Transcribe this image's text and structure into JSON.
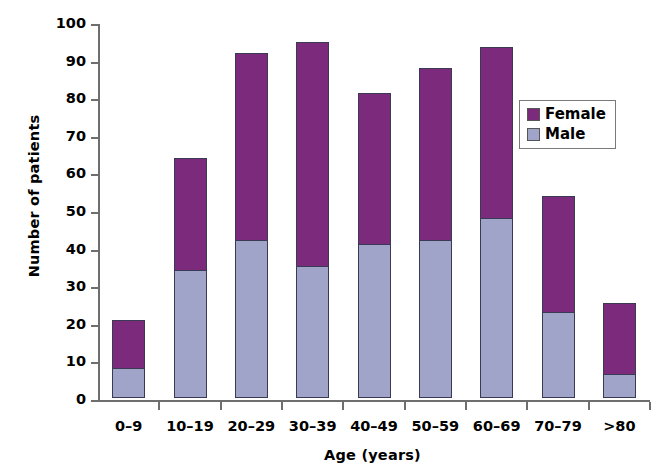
{
  "chart_data": {
    "type": "bar",
    "stacked": true,
    "title": "",
    "xlabel": "Age (years)",
    "ylabel": "Number of patients",
    "categories": [
      "0–9",
      "10–19",
      "20–29",
      "30–39",
      "40–49",
      "50–59",
      "60–69",
      "70–79",
      ">80"
    ],
    "series": [
      {
        "name": "Male",
        "color": "#a0a4c9",
        "values": [
          8,
          34,
          42,
          35,
          41,
          42,
          48,
          23,
          6.5
        ]
      },
      {
        "name": "Female",
        "color": "#7c2a7c",
        "values": [
          13,
          30,
          50,
          60,
          40.5,
          46,
          45.5,
          31,
          19
        ]
      }
    ],
    "totals": [
      21,
      64,
      92,
      95,
      81.5,
      88,
      93.5,
      54,
      25.5
    ],
    "ylim": [
      0,
      100
    ],
    "yticks": [
      0,
      10,
      20,
      30,
      40,
      50,
      60,
      70,
      80,
      90,
      100
    ],
    "ytick_labels": [
      "0",
      "10",
      "20",
      "30",
      "40",
      "50",
      "60",
      "70",
      "80",
      "90",
      "100"
    ],
    "grid": false,
    "legend_position": "upper right",
    "legend_entries": [
      "Female",
      "Male"
    ]
  }
}
